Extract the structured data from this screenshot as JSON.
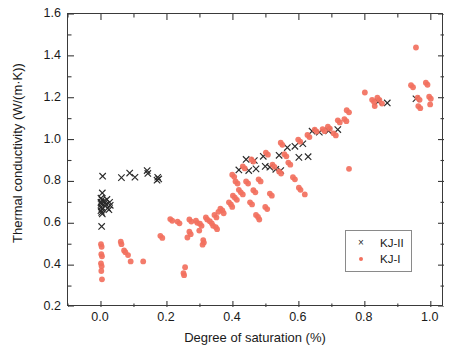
{
  "chart_data": {
    "type": "scatter",
    "title": "",
    "xlabel": "Degree of saturation (%)",
    "ylabel": "Thermal conductivity (W/(m·K))",
    "xlim": [
      -0.1,
      1.04
    ],
    "ylim": [
      0.2,
      1.6
    ],
    "xticks": [
      "0.0",
      "0.2",
      "0.4",
      "0.6",
      "0.8",
      "1.0"
    ],
    "xtick_values": [
      0.0,
      0.2,
      0.4,
      0.6,
      0.8,
      1.0
    ],
    "yticks": [
      "0.2",
      "0.4",
      "0.6",
      "0.8",
      "1.0",
      "1.2",
      "1.4",
      "1.6"
    ],
    "ytick_values": [
      0.2,
      0.4,
      0.6,
      0.8,
      1.0,
      1.2,
      1.4,
      1.6
    ],
    "grid": false,
    "minor_ticks": true,
    "legend_position": "lower-right",
    "series": [
      {
        "name": "KJ-II",
        "marker": "x",
        "color": "#2a2a2a",
        "points": [
          [
            0.005,
            0.825
          ],
          [
            0.004,
            0.745
          ],
          [
            0.0,
            0.7
          ],
          [
            0.002,
            0.692
          ],
          [
            0.001,
            0.678
          ],
          [
            0.003,
            0.668
          ],
          [
            0.0,
            0.66
          ],
          [
            0.002,
            0.652
          ],
          [
            0.004,
            0.645
          ],
          [
            0.001,
            0.7
          ],
          [
            0.003,
            0.712
          ],
          [
            0.0,
            0.72
          ],
          [
            0.012,
            0.697
          ],
          [
            0.016,
            0.69
          ],
          [
            0.02,
            0.672
          ],
          [
            0.024,
            0.665
          ],
          [
            0.028,
            0.686
          ],
          [
            0.01,
            0.706
          ],
          [
            0.018,
            0.714
          ],
          [
            0.026,
            0.7
          ],
          [
            0.002,
            0.585
          ],
          [
            0.062,
            0.818
          ],
          [
            0.087,
            0.84
          ],
          [
            0.103,
            0.82
          ],
          [
            0.14,
            0.852
          ],
          [
            0.142,
            0.838
          ],
          [
            0.172,
            0.82
          ],
          [
            0.175,
            0.812
          ],
          [
            0.17,
            0.806
          ],
          [
            0.44,
            0.905
          ],
          [
            0.465,
            0.9
          ],
          [
            0.492,
            0.92
          ],
          [
            0.54,
            0.925
          ],
          [
            0.418,
            0.855
          ],
          [
            0.448,
            0.852
          ],
          [
            0.47,
            0.86
          ],
          [
            0.498,
            0.872
          ],
          [
            0.512,
            0.868
          ],
          [
            0.53,
            0.858
          ],
          [
            0.545,
            0.852
          ],
          [
            0.565,
            0.962
          ],
          [
            0.588,
            0.968
          ],
          [
            0.612,
            0.98
          ],
          [
            0.64,
            1.04
          ],
          [
            0.662,
            1.035
          ],
          [
            0.69,
            1.042
          ],
          [
            0.718,
            1.048
          ],
          [
            0.6,
            0.915
          ],
          [
            0.628,
            0.918
          ],
          [
            0.84,
            1.18
          ],
          [
            0.868,
            1.175
          ],
          [
            0.955,
            1.195
          ]
        ]
      },
      {
        "name": "KJ-I",
        "marker": "dot",
        "color": "#f2705e",
        "points": [
          [
            0.0,
            0.5
          ],
          [
            0.002,
            0.488
          ],
          [
            0.001,
            0.452
          ],
          [
            0.003,
            0.442
          ],
          [
            0.0,
            0.408
          ],
          [
            0.002,
            0.395
          ],
          [
            0.001,
            0.372
          ],
          [
            0.003,
            0.332
          ],
          [
            0.06,
            0.512
          ],
          [
            0.062,
            0.5
          ],
          [
            0.07,
            0.47
          ],
          [
            0.074,
            0.462
          ],
          [
            0.082,
            0.448
          ],
          [
            0.09,
            0.418
          ],
          [
            0.128,
            0.418
          ],
          [
            0.25,
            0.362
          ],
          [
            0.252,
            0.352
          ],
          [
            0.255,
            0.39
          ],
          [
            0.268,
            0.56
          ],
          [
            0.272,
            0.548
          ],
          [
            0.262,
            0.532
          ],
          [
            0.3,
            0.598
          ],
          [
            0.305,
            0.588
          ],
          [
            0.298,
            0.565
          ],
          [
            0.31,
            0.52
          ],
          [
            0.312,
            0.508
          ],
          [
            0.308,
            0.498
          ],
          [
            0.33,
            0.61
          ],
          [
            0.336,
            0.6
          ],
          [
            0.34,
            0.588
          ],
          [
            0.344,
            0.64
          ],
          [
            0.35,
            0.628
          ],
          [
            0.356,
            0.655
          ],
          [
            0.362,
            0.67
          ],
          [
            0.368,
            0.662
          ],
          [
            0.372,
            0.648
          ],
          [
            0.388,
            0.7
          ],
          [
            0.394,
            0.69
          ],
          [
            0.398,
            0.678
          ],
          [
            0.4,
            0.732
          ],
          [
            0.406,
            0.722
          ],
          [
            0.412,
            0.712
          ],
          [
            0.418,
            0.76
          ],
          [
            0.424,
            0.748
          ],
          [
            0.43,
            0.738
          ],
          [
            0.348,
            0.582
          ],
          [
            0.352,
            0.572
          ],
          [
            0.288,
            0.612
          ],
          [
            0.292,
            0.602
          ],
          [
            0.318,
            0.628
          ],
          [
            0.322,
            0.618
          ],
          [
            0.268,
            0.618
          ],
          [
            0.274,
            0.608
          ],
          [
            0.232,
            0.608
          ],
          [
            0.238,
            0.6
          ],
          [
            0.21,
            0.62
          ],
          [
            0.216,
            0.612
          ],
          [
            0.452,
            0.7
          ],
          [
            0.458,
            0.69
          ],
          [
            0.462,
            0.758
          ],
          [
            0.468,
            0.748
          ],
          [
            0.47,
            0.64
          ],
          [
            0.476,
            0.63
          ],
          [
            0.48,
            0.618
          ],
          [
            0.498,
            0.678
          ],
          [
            0.504,
            0.668
          ],
          [
            0.512,
            0.742
          ],
          [
            0.518,
            0.732
          ],
          [
            0.52,
            0.88
          ],
          [
            0.526,
            0.87
          ],
          [
            0.478,
            0.81
          ],
          [
            0.484,
            0.8
          ],
          [
            0.44,
            0.8
          ],
          [
            0.446,
            0.79
          ],
          [
            0.408,
            0.8
          ],
          [
            0.414,
            0.79
          ],
          [
            0.398,
            0.832
          ],
          [
            0.404,
            0.822
          ],
          [
            0.43,
            0.872
          ],
          [
            0.436,
            0.862
          ],
          [
            0.456,
            0.905
          ],
          [
            0.462,
            0.895
          ],
          [
            0.5,
            0.938
          ],
          [
            0.506,
            0.928
          ],
          [
            0.545,
            0.985
          ],
          [
            0.55,
            0.975
          ],
          [
            0.556,
            0.93
          ],
          [
            0.562,
            0.92
          ],
          [
            0.568,
            0.89
          ],
          [
            0.574,
            0.88
          ],
          [
            0.54,
            0.848
          ],
          [
            0.546,
            0.838
          ],
          [
            0.582,
            0.82
          ],
          [
            0.588,
            0.81
          ],
          [
            0.6,
            0.77
          ],
          [
            0.605,
            0.76
          ],
          [
            0.618,
            0.738
          ],
          [
            0.598,
            1.0
          ],
          [
            0.604,
            0.99
          ],
          [
            0.626,
            1.022
          ],
          [
            0.632,
            1.012
          ],
          [
            0.648,
            1.048
          ],
          [
            0.654,
            1.038
          ],
          [
            0.672,
            1.05
          ],
          [
            0.678,
            1.04
          ],
          [
            0.688,
            1.062
          ],
          [
            0.694,
            1.052
          ],
          [
            0.705,
            1.03
          ],
          [
            0.712,
            1.02
          ],
          [
            0.718,
            1.092
          ],
          [
            0.724,
            1.082
          ],
          [
            0.738,
            1.098
          ],
          [
            0.744,
            1.088
          ],
          [
            0.745,
            1.14
          ],
          [
            0.752,
            1.13
          ],
          [
            0.752,
            0.86
          ],
          [
            0.8,
            1.225
          ],
          [
            0.822,
            1.19
          ],
          [
            0.828,
            1.18
          ],
          [
            0.838,
            1.2
          ],
          [
            0.844,
            1.19
          ],
          [
            0.852,
            1.172
          ],
          [
            0.83,
            1.16
          ],
          [
            0.955,
            1.44
          ],
          [
            0.94,
            1.26
          ],
          [
            0.946,
            1.25
          ],
          [
            0.985,
            1.272
          ],
          [
            0.99,
            1.262
          ],
          [
            0.96,
            1.2
          ],
          [
            0.966,
            1.19
          ],
          [
            0.995,
            1.205
          ],
          [
            1.0,
            1.195
          ],
          [
            0.962,
            1.16
          ],
          [
            0.968,
            1.15
          ],
          [
            0.998,
            1.168
          ],
          [
            0.18,
            0.54
          ],
          [
            0.186,
            0.53
          ]
        ]
      }
    ]
  },
  "legend": {
    "entries": [
      {
        "symbol": "×",
        "label": "KJ-II"
      },
      {
        "symbol": "•",
        "label": "KJ-I"
      }
    ]
  }
}
